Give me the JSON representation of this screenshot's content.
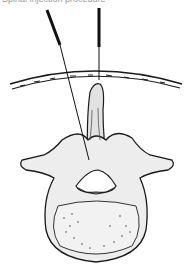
{
  "figure": {
    "caption_cropped": "Spinal injection procedure",
    "elements": [
      "skin-layer",
      "needle-oblique",
      "needle-vertical",
      "spinous-process",
      "transverse-processes",
      "vertebral-foramen",
      "vertebral-body"
    ]
  },
  "colors": {
    "line": "#1a1a1a",
    "bone_fill": "#ededed",
    "shade": "#c8c8c8",
    "background": "#ffffff"
  }
}
